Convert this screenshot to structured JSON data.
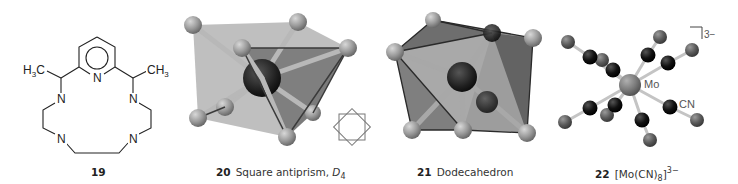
{
  "figures": [
    {
      "id": "19",
      "number": "19",
      "caption": "",
      "type": "structural-formula",
      "atoms": {
        "methyl_left": "H3C",
        "methyl_right": "CH3",
        "pyridine_n": "N",
        "amine_n": [
          "N",
          "N",
          "N",
          "N"
        ]
      }
    },
    {
      "id": "20",
      "number": "20",
      "caption": "Square antiprism, ",
      "symmetry": "D",
      "symmetry_sub": "4",
      "type": "polyhedron-model",
      "inset_icon": "square-antiprism-symbol"
    },
    {
      "id": "21",
      "number": "21",
      "caption": "Dodecahedron",
      "type": "polyhedron-model"
    },
    {
      "id": "22",
      "number": "22",
      "caption_prefix": "[Mo(CN)",
      "caption_sub": "8",
      "caption_suffix": "]",
      "caption_sup": "3−",
      "type": "ball-and-stick-model",
      "labels": {
        "metal": "Mo",
        "ligand": "CN",
        "charge": "3−"
      }
    }
  ],
  "colors": {
    "ligand_atom": "#9a9a9a",
    "central_atom": "#1e1e1e",
    "polyhedron_fill": "#6e6e6e",
    "mo_atom": "#7c7c7c",
    "c_atom": "#111111",
    "n_atom": "#5a5a5a"
  }
}
